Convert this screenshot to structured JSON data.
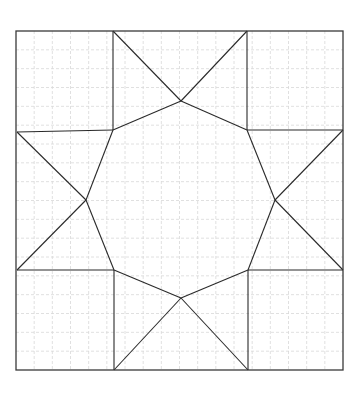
{
  "diagram": {
    "type": "geometric-quilt-pattern",
    "colors": {
      "background": "#ffffff",
      "grid": "#d8d8d8",
      "stroke": "#2a2a2a",
      "frame": "#3a3a3a"
    },
    "frame": {
      "x": 16,
      "y": 31,
      "width": 327,
      "height": 339
    },
    "grid": {
      "divisions_x": 18,
      "divisions_y": 18
    },
    "points": {
      "top_left_inner": [
        113,
        31
      ],
      "top_right_inner": [
        247,
        31
      ],
      "top_apex": [
        181,
        101
      ],
      "upper_left_corner": [
        113,
        130
      ],
      "upper_right_corner": [
        247,
        130
      ],
      "left_top_edge": [
        17,
        132
      ],
      "left_bottom_edge": [
        17,
        270
      ],
      "right_top_edge": [
        343,
        130
      ],
      "right_bottom_edge": [
        343,
        270
      ],
      "left_apex": [
        86,
        200
      ],
      "right_apex": [
        275,
        200
      ],
      "lower_left_corner": [
        114,
        270
      ],
      "lower_right_corner": [
        248,
        270
      ],
      "bottom_apex": [
        181,
        298
      ],
      "bottom_left_inner": [
        114,
        370
      ],
      "bottom_right_inner": [
        248,
        370
      ]
    }
  }
}
